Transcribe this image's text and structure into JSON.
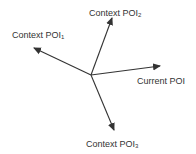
{
  "diagram": {
    "type": "vector-diagram",
    "origin": {
      "x": 91,
      "y": 75
    },
    "stroke_color": "#333333",
    "label_color": "#333333",
    "background": "#ffffff",
    "arrows": [
      {
        "id": "poi2",
        "to": {
          "x": 112,
          "y": 18
        }
      },
      {
        "id": "poi1",
        "to": {
          "x": 34,
          "y": 48
        }
      },
      {
        "id": "current",
        "to": {
          "x": 160,
          "y": 66
        }
      },
      {
        "id": "poi3",
        "to": {
          "x": 114,
          "y": 130
        }
      }
    ],
    "labels": {
      "poi2": {
        "text": "Context POI",
        "subscript": "2"
      },
      "poi1": {
        "text": "Context POI",
        "subscript": "1"
      },
      "current": {
        "text": "Current POI",
        "subscript": ""
      },
      "poi3": {
        "text": "Context POI",
        "subscript": "3"
      }
    }
  }
}
